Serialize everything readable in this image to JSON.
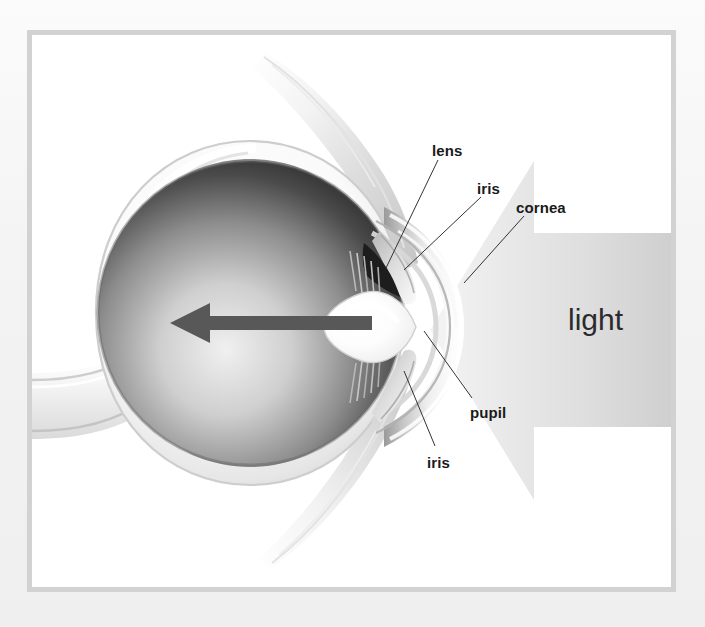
{
  "figure": {
    "background_color": "#f2f2f2",
    "canvas_color": "#ffffff",
    "frame_color": "#d2d2d2"
  },
  "labels": [
    {
      "id": "lens",
      "text": "lens",
      "x": 432,
      "y": 143
    },
    {
      "id": "iris_top",
      "text": "iris",
      "x": 477,
      "y": 181
    },
    {
      "id": "cornea",
      "text": "cornea",
      "x": 516,
      "y": 200
    },
    {
      "id": "pupil",
      "text": "pupil",
      "x": 470,
      "y": 405
    },
    {
      "id": "iris_bot",
      "text": "iris",
      "x": 427,
      "y": 455
    }
  ],
  "light_label": {
    "text": "light",
    "x": 568,
    "y": 305,
    "color": "#2b2b2b"
  },
  "leader_lines": [
    {
      "id": "lens-leader",
      "from_label": "lens",
      "x1": 438,
      "y1": 160,
      "x2": 386,
      "y2": 268
    },
    {
      "id": "iris-top-leader",
      "from_label": "iris",
      "x1": 481,
      "y1": 197,
      "x2": 404,
      "y2": 270
    },
    {
      "id": "cornea-leader",
      "from_label": "cornea",
      "x1": 524,
      "y1": 216,
      "x2": 464,
      "y2": 283
    },
    {
      "id": "pupil-leader",
      "from_label": "pupil",
      "x1": 472,
      "y1": 398,
      "x2": 424,
      "y2": 331
    },
    {
      "id": "iris-bot-leader",
      "from_label": "iris",
      "x1": 435,
      "y1": 446,
      "x2": 404,
      "y2": 371
    }
  ],
  "structures": {
    "sclera": {
      "name": "sclera",
      "color": "#fdfdfd"
    },
    "choroid": {
      "name": "choroid-retina",
      "color": "#8e8e8e"
    },
    "vitreous": {
      "name": "vitreous-body",
      "color_dark": "#2a2a2a",
      "color_light": "#e8e8e8"
    },
    "lens": {
      "name": "lens",
      "color": "#fbfbfb"
    },
    "cornea": {
      "name": "cornea",
      "color": "#e9e9e9"
    },
    "iris": {
      "name": "iris",
      "color": "#cfcfcf"
    },
    "optic_nerve": {
      "name": "optic-nerve",
      "color": "#f6f6f6"
    },
    "muscles": {
      "name": "extraocular-muscles",
      "color": "#ededed"
    },
    "pupil": {
      "name": "pupil",
      "color": "#1b1b1b"
    }
  },
  "direction_arrow": {
    "name": "light-path-arrow",
    "color": "#5a5a5a",
    "direction": "left",
    "x_tail": 340,
    "x_head": 138,
    "y": 288
  },
  "light_beam": {
    "name": "incoming-light-arrow",
    "direction": "left",
    "color_start": "#ffffff",
    "color_end": "#d9d9d9"
  }
}
